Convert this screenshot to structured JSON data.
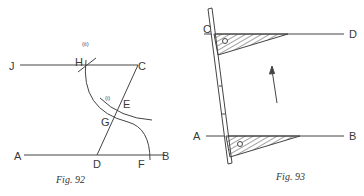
{
  "figures": [
    {
      "caption": "Fig. 92",
      "points": {
        "J": "J",
        "H": "H",
        "C": "C",
        "A": "A",
        "D": "D",
        "F": "F",
        "B": "B",
        "E": "E",
        "G": "G"
      },
      "arc_labels": {
        "i": "(i)",
        "ii": "(ii)"
      },
      "description": "Construction of a line JC parallel to AB through C using arcs"
    },
    {
      "caption": "Fig. 93",
      "points": {
        "C": "C",
        "D": "D",
        "A": "A",
        "B": "B"
      },
      "description": "Set square slid along a ruler to draw parallel lines AB and CD; arrow shows direction of motion"
    }
  ],
  "colors": {
    "ink": "#3a3a3a",
    "background": "#ffffff"
  }
}
